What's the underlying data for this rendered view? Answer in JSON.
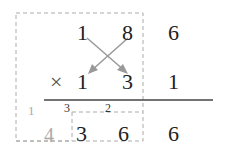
{
  "top_row": [
    "1",
    "8",
    "6"
  ],
  "operator": "×",
  "bottom_row": [
    "1",
    "3",
    "1"
  ],
  "carries": [
    "3",
    "2"
  ],
  "result": [
    "3",
    "6",
    "6"
  ],
  "side_carry": "1",
  "box_digit": "4",
  "colors": {
    "arrow": "#999999",
    "dashed": "#aaaaaa",
    "line": "#444444"
  }
}
